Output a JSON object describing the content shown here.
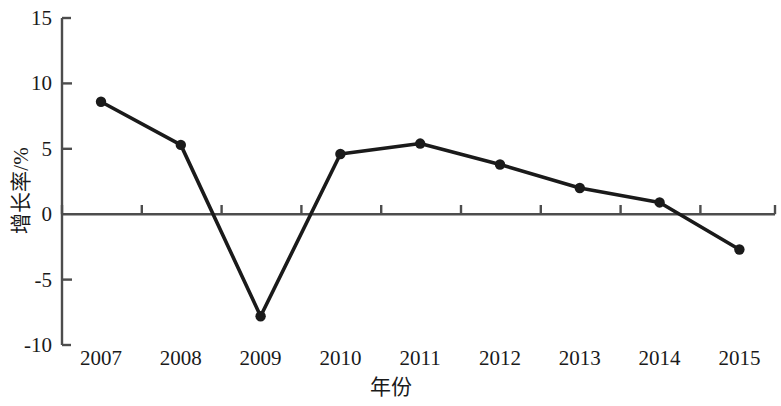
{
  "chart_data": {
    "type": "line",
    "title": "",
    "xlabel": "年份",
    "ylabel": "增长率/%",
    "categories": [
      "2007",
      "2008",
      "2009",
      "2010",
      "2011",
      "2012",
      "2013",
      "2014",
      "2015"
    ],
    "values": [
      8.6,
      5.3,
      -7.8,
      4.6,
      5.4,
      3.8,
      2.0,
      0.9,
      -2.7
    ],
    "series": [
      {
        "name": "增长率",
        "values": [
          8.6,
          5.3,
          -7.8,
          4.6,
          5.4,
          3.8,
          2.0,
          0.9,
          -2.7
        ]
      }
    ],
    "ylim": [
      -10,
      15
    ],
    "yticks": [
      15,
      10,
      5,
      0,
      -5,
      -10
    ],
    "ytick_labels": [
      "15",
      "10",
      "5",
      "0",
      "-5",
      "-10"
    ],
    "xtick_labels": [
      "2007",
      "2008",
      "2009",
      "2010",
      "2011",
      "2012",
      "2013",
      "2014",
      "2015"
    ],
    "grid": false,
    "legend": "none",
    "line_color": "#1a1a1a",
    "marker_color": "#1a1a1a",
    "axis_color": "#4d4d4d",
    "marker": "circle",
    "zero_line": true
  },
  "axes": {
    "y_title": "增长率/%",
    "x_title": "年份"
  }
}
